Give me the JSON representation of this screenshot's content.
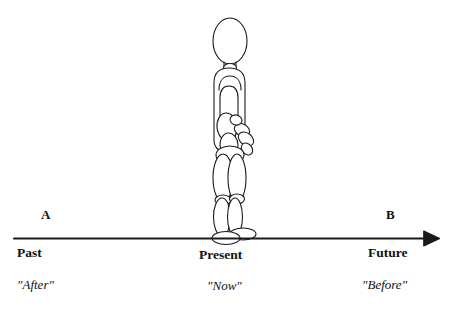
{
  "diagram": {
    "title_visible": false,
    "type": "timeline-with-figure",
    "colors": {
      "axis": "#1a1a1a",
      "text": "#111111",
      "figure_stroke": "#1a1a1a",
      "background": "#ffffff"
    },
    "axis": {
      "name": "time-arrow",
      "orientation": "horizontal",
      "direction": "left-to-right",
      "arrowhead": "right-solid-triangle",
      "y": 238,
      "x_start": 14,
      "x_end": 432
    },
    "endpoints": {
      "left": {
        "marker": "A",
        "era": "Past",
        "gloss": "\"After\""
      },
      "right": {
        "marker": "B",
        "era": "Future",
        "gloss": "\"Before\""
      }
    },
    "center": {
      "era": "Present",
      "gloss": "\"Now\"",
      "x": 228,
      "figure": "standing-person"
    },
    "figure": {
      "name": "standing-human-figure",
      "description": "side-view mannequin drawn from overlapping ellipses and rounded shapes",
      "parts": [
        "head",
        "neck",
        "torso",
        "upper-arm",
        "forearm",
        "hand",
        "fingers",
        "hip",
        "thigh-front",
        "thigh-back",
        "knee-front",
        "knee-back",
        "shin-front",
        "shin-back",
        "foot-front",
        "foot-back"
      ]
    }
  }
}
